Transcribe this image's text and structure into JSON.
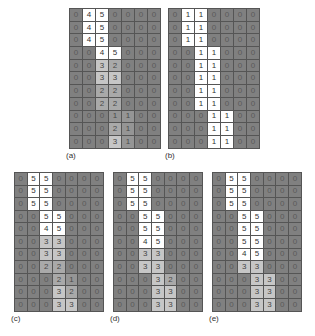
{
  "figure": {
    "panels": [
      {
        "id": "a",
        "label": "(a)",
        "x": 69,
        "y": 8,
        "cell_w": 12,
        "cell_h": 11.7,
        "label_x": 66,
        "label_y": 151,
        "rows": [
          [
            0,
            4,
            5,
            0,
            0,
            0,
            0
          ],
          [
            0,
            4,
            5,
            0,
            0,
            0,
            0
          ],
          [
            0,
            4,
            5,
            0,
            0,
            0,
            0
          ],
          [
            0,
            0,
            4,
            5,
            0,
            0,
            0
          ],
          [
            0,
            0,
            3,
            2,
            0,
            0,
            0
          ],
          [
            0,
            0,
            3,
            3,
            0,
            0,
            0
          ],
          [
            0,
            0,
            2,
            2,
            0,
            0,
            0
          ],
          [
            0,
            0,
            2,
            2,
            0,
            0,
            0
          ],
          [
            0,
            0,
            0,
            1,
            1,
            0,
            0
          ],
          [
            0,
            0,
            0,
            2,
            1,
            0,
            0
          ],
          [
            0,
            0,
            0,
            3,
            1,
            0,
            0
          ]
        ],
        "binary": false
      },
      {
        "id": "b",
        "label": "(b)",
        "x": 168,
        "y": 8,
        "cell_w": 12,
        "cell_h": 11.7,
        "label_x": 165,
        "label_y": 151,
        "rows": [
          [
            0,
            1,
            1,
            0,
            0,
            0,
            0
          ],
          [
            0,
            1,
            1,
            0,
            0,
            0,
            0
          ],
          [
            0,
            1,
            1,
            0,
            0,
            0,
            0
          ],
          [
            0,
            0,
            1,
            1,
            0,
            0,
            0
          ],
          [
            0,
            0,
            1,
            1,
            0,
            0,
            0
          ],
          [
            0,
            0,
            1,
            1,
            0,
            0,
            0
          ],
          [
            0,
            0,
            1,
            1,
            0,
            0,
            0
          ],
          [
            0,
            0,
            1,
            1,
            0,
            0,
            0
          ],
          [
            0,
            0,
            0,
            1,
            1,
            0,
            0
          ],
          [
            0,
            0,
            0,
            1,
            1,
            0,
            0
          ],
          [
            0,
            0,
            0,
            1,
            1,
            0,
            0
          ]
        ],
        "binary": true
      },
      {
        "id": "c",
        "label": "(c)",
        "x": 14,
        "y": 172,
        "cell_w": 11.7,
        "cell_h": 11.6,
        "label_x": 11,
        "label_y": 314,
        "rows": [
          [
            0,
            5,
            5,
            0,
            0,
            0,
            0
          ],
          [
            0,
            5,
            5,
            0,
            0,
            0,
            0
          ],
          [
            0,
            5,
            5,
            0,
            0,
            0,
            0
          ],
          [
            0,
            0,
            5,
            5,
            0,
            0,
            0
          ],
          [
            0,
            0,
            4,
            5,
            0,
            0,
            0
          ],
          [
            0,
            0,
            3,
            3,
            0,
            0,
            0
          ],
          [
            0,
            0,
            3,
            3,
            0,
            0,
            0
          ],
          [
            0,
            0,
            2,
            2,
            0,
            0,
            0
          ],
          [
            0,
            0,
            0,
            2,
            1,
            0,
            0
          ],
          [
            0,
            0,
            0,
            3,
            2,
            0,
            0
          ],
          [
            0,
            0,
            0,
            3,
            3,
            0,
            0
          ]
        ],
        "binary": false
      },
      {
        "id": "d",
        "label": "(d)",
        "x": 113,
        "y": 172,
        "cell_w": 11.7,
        "cell_h": 11.6,
        "label_x": 110,
        "label_y": 314,
        "rows": [
          [
            0,
            5,
            5,
            0,
            0,
            0,
            0
          ],
          [
            0,
            5,
            5,
            0,
            0,
            0,
            0
          ],
          [
            0,
            5,
            5,
            0,
            0,
            0,
            0
          ],
          [
            0,
            0,
            5,
            5,
            0,
            0,
            0
          ],
          [
            0,
            0,
            5,
            5,
            0,
            0,
            0
          ],
          [
            0,
            0,
            4,
            5,
            0,
            0,
            0
          ],
          [
            0,
            0,
            3,
            3,
            0,
            0,
            0
          ],
          [
            0,
            0,
            3,
            3,
            0,
            0,
            0
          ],
          [
            0,
            0,
            0,
            3,
            2,
            0,
            0
          ],
          [
            0,
            0,
            0,
            3,
            3,
            0,
            0
          ],
          [
            0,
            0,
            0,
            3,
            3,
            0,
            0
          ]
        ],
        "binary": false
      },
      {
        "id": "e",
        "label": "(e)",
        "x": 212,
        "y": 172,
        "cell_w": 11.7,
        "cell_h": 11.6,
        "label_x": 209,
        "label_y": 314,
        "rows": [
          [
            0,
            5,
            5,
            0,
            0,
            0,
            0
          ],
          [
            0,
            5,
            5,
            0,
            0,
            0,
            0
          ],
          [
            0,
            5,
            5,
            0,
            0,
            0,
            0
          ],
          [
            0,
            0,
            5,
            5,
            0,
            0,
            0
          ],
          [
            0,
            0,
            5,
            5,
            0,
            0,
            0
          ],
          [
            0,
            0,
            5,
            5,
            0,
            0,
            0
          ],
          [
            0,
            0,
            4,
            5,
            0,
            0,
            0
          ],
          [
            0,
            0,
            3,
            3,
            0,
            0,
            0
          ],
          [
            0,
            0,
            0,
            3,
            3,
            0,
            0
          ],
          [
            0,
            0,
            0,
            3,
            3,
            0,
            0
          ],
          [
            0,
            0,
            0,
            3,
            3,
            0,
            0
          ]
        ],
        "binary": false
      }
    ]
  },
  "colors": {
    "v0": "#808080",
    "v1": "#959595",
    "v2": "#a9a9a9",
    "v3": "#c6c6c6",
    "v4": "#ffffff",
    "v5": "#ffffff",
    "grid_line": "#555555"
  }
}
